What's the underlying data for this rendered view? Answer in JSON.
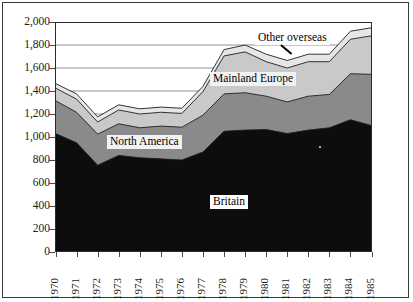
{
  "chart_data": {
    "type": "area",
    "stacked": true,
    "title": "",
    "subtitle": "",
    "xlabel": "",
    "ylabel": "",
    "xlim": [
      1970,
      1985
    ],
    "ylim": [
      0,
      2000
    ],
    "ytick_step": 200,
    "grid": true,
    "grid_orientation": "horizontal",
    "legend_position": "inline-labels",
    "x": [
      1970,
      1971,
      1972,
      1973,
      1974,
      1975,
      1976,
      1977,
      1978,
      1979,
      1980,
      1981,
      1982,
      1983,
      1984,
      1985
    ],
    "xtick_labels": [
      "1970",
      "1971",
      "1972",
      "1973",
      "1974",
      "1975",
      "1976",
      "1977",
      "1978",
      "1979",
      "1980",
      "1981",
      "1982",
      "1983",
      "1984",
      "1985"
    ],
    "ytick_labels": [
      "0",
      "200",
      "400",
      "600",
      "800",
      "1,000",
      "1,200",
      "1,400",
      "1,600",
      "1,800",
      "2,000"
    ],
    "ytick_values": [
      0,
      200,
      400,
      600,
      800,
      1000,
      1200,
      1400,
      1600,
      1800,
      2000
    ],
    "series": [
      {
        "name": "Britain",
        "color": "#0d0d0d",
        "values": [
          1030,
          950,
          755,
          840,
          820,
          810,
          800,
          870,
          1050,
          1060,
          1065,
          1030,
          1060,
          1080,
          1150,
          1100
        ]
      },
      {
        "name": "North America",
        "color": "#8a8a8a",
        "values": [
          285,
          265,
          270,
          275,
          260,
          285,
          285,
          320,
          325,
          325,
          290,
          275,
          295,
          290,
          400,
          445
        ]
      },
      {
        "name": "Mainland Europe",
        "color": "#c9c9c9",
        "values": [
          110,
          115,
          105,
          120,
          120,
          120,
          120,
          205,
          330,
          355,
          300,
          295,
          300,
          285,
          300,
          335
        ]
      },
      {
        "name": "Other overseas",
        "color": "#e6e6e6",
        "values": [
          40,
          45,
          45,
          45,
          45,
          45,
          45,
          45,
          55,
          60,
          65,
          65,
          65,
          65,
          70,
          70
        ]
      }
    ],
    "totals": [
      1465,
      1375,
      1175,
      1280,
      1245,
      1260,
      1250,
      1440,
      1760,
      1800,
      1720,
      1665,
      1720,
      1720,
      1920,
      1950
    ],
    "annotations": [
      {
        "text": "Other overseas",
        "series": "Other overseas",
        "kind": "series-label",
        "has_leader_line": true
      },
      {
        "text": "Mainland Europe",
        "series": "Mainland Europe",
        "kind": "series-label",
        "has_leader_line": false
      },
      {
        "text": "North America",
        "series": "North America",
        "kind": "series-label",
        "has_leader_line": false
      },
      {
        "text": "Britain",
        "series": "Britain",
        "kind": "series-label",
        "has_leader_line": false
      }
    ]
  },
  "labels": {
    "britain": "Britain",
    "north_america": "North America",
    "mainland_europe": "Mainland Europe",
    "other_overseas": "Other overseas"
  },
  "colors": {
    "britain": "#0d0d0d",
    "north_america": "#8a8a8a",
    "mainland_europe": "#c9c9c9",
    "other_overseas": "#e6e6e6",
    "gridline": "#8f8f8f",
    "axis": "#2b2b2b",
    "frame": "#3a3a3a"
  }
}
